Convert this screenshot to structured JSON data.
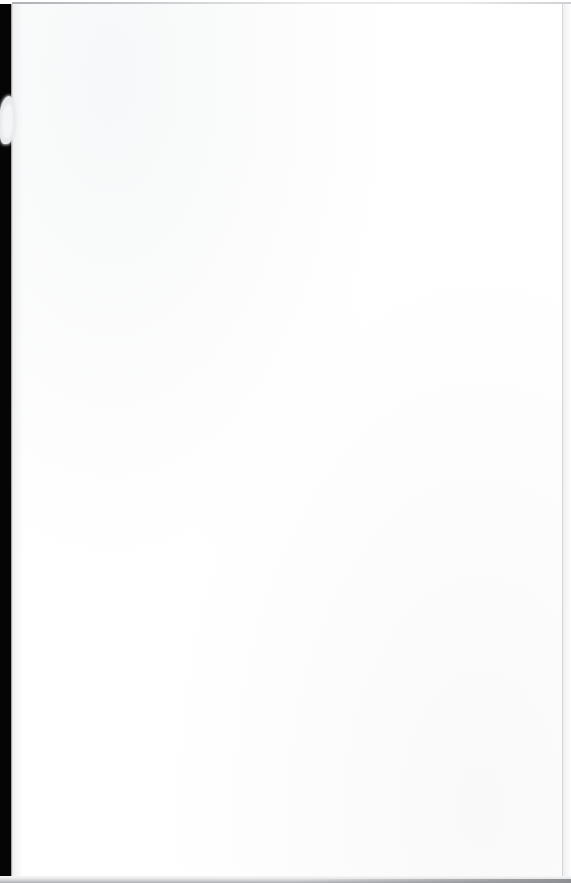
{
  "document": {
    "kind": "scanned-page",
    "page_content_text": "",
    "blank_page_note": "",
    "visible_text_items": []
  },
  "page": {
    "width_px": 571,
    "height_px": 883,
    "paper_left_px": 12,
    "paper_top_px": 4,
    "paper_width_px": 552,
    "paper_height_px": 874
  },
  "colors": {
    "paper_white": "#ffffff",
    "scanner_dark": "#050505",
    "notch_gray": "#e9eaec",
    "edge_line_gray": "#cdcfd3",
    "bottom_band_gray": "#a8a9ac",
    "top_seam_gray": "#96989c"
  },
  "artifacts": {
    "left_strip": "left-dark-strip",
    "edge_notch": "edge-notch",
    "top_seam": "top-seam",
    "right_edge": "right-edge",
    "bottom_band": "bottom-band"
  }
}
